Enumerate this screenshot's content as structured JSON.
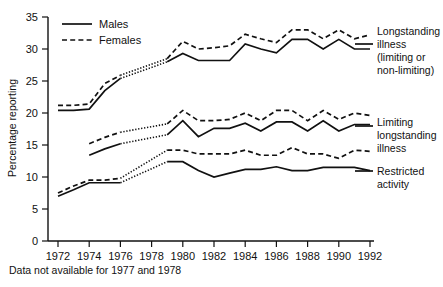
{
  "chart_data": {
    "type": "line",
    "title": "",
    "xlabel": "",
    "ylabel": "Percentage reporting",
    "xlim": [
      1972,
      1992
    ],
    "ylim": [
      0,
      35
    ],
    "grid": false,
    "legend_position": "top-left",
    "x_ticks": [
      1972,
      1974,
      1976,
      1978,
      1980,
      1982,
      1984,
      1986,
      1988,
      1990,
      1992
    ],
    "y_ticks": [
      0,
      5,
      10,
      15,
      20,
      25,
      30,
      35
    ],
    "footnote": "Data not available for 1977 and 1978",
    "legend": [
      {
        "label": "Males",
        "style": "solid"
      },
      {
        "label": "Females",
        "style": "dashed"
      }
    ],
    "annotations": [
      {
        "id": "longstanding",
        "lines": [
          "Longstanding",
          "illness",
          "(limiting or",
          "non-limiting)"
        ]
      },
      {
        "id": "limiting",
        "lines": [
          "Limiting",
          "longstanding",
          "illness"
        ]
      },
      {
        "id": "restricted",
        "lines": [
          "Restricted",
          "activity"
        ]
      }
    ],
    "gap_years": [
      1977,
      1978
    ],
    "series": [
      {
        "name": "Longstanding illness (limiting or non-limiting) - Males",
        "group": "longstanding",
        "sex": "Males",
        "style": "solid",
        "x": [
          1972,
          1973,
          1974,
          1975,
          1976,
          1979,
          1980,
          1981,
          1982,
          1983,
          1984,
          1985,
          1986,
          1987,
          1988,
          1989,
          1990,
          1991,
          1992
        ],
        "values": [
          20.4,
          20.4,
          20.6,
          23.5,
          25.4,
          28.0,
          29.3,
          28.2,
          28.2,
          28.2,
          30.8,
          30.0,
          29.4,
          31.5,
          31.5,
          30.0,
          31.5,
          30.0,
          30.0
        ]
      },
      {
        "name": "Longstanding illness (limiting or non-limiting) - Females",
        "group": "longstanding",
        "sex": "Females",
        "style": "dashed",
        "x": [
          1972,
          1973,
          1974,
          1975,
          1976,
          1979,
          1980,
          1981,
          1982,
          1983,
          1984,
          1985,
          1986,
          1987,
          1988,
          1989,
          1990,
          1991,
          1992
        ],
        "values": [
          21.2,
          21.2,
          21.4,
          24.6,
          25.9,
          28.5,
          31.2,
          30.0,
          30.2,
          30.5,
          32.3,
          31.6,
          31.0,
          33.0,
          33.0,
          31.6,
          33.0,
          31.6,
          32.2
        ]
      },
      {
        "name": "Limiting longstanding illness - Males",
        "group": "limiting",
        "sex": "Males",
        "style": "solid",
        "x": [
          1974,
          1975,
          1976,
          1979,
          1980,
          1981,
          1982,
          1983,
          1984,
          1985,
          1986,
          1987,
          1988,
          1989,
          1990,
          1991,
          1992
        ],
        "values": [
          13.4,
          14.4,
          15.2,
          16.6,
          18.8,
          16.3,
          17.6,
          17.6,
          18.4,
          17.2,
          18.6,
          18.6,
          17.2,
          18.8,
          17.2,
          18.2,
          18.2
        ]
      },
      {
        "name": "Limiting longstanding illness - Females",
        "group": "limiting",
        "sex": "Females",
        "style": "dashed",
        "x": [
          1974,
          1975,
          1976,
          1979,
          1980,
          1981,
          1982,
          1983,
          1984,
          1985,
          1986,
          1987,
          1988,
          1989,
          1990,
          1991,
          1992
        ],
        "values": [
          15.2,
          16.2,
          17.0,
          18.3,
          20.4,
          18.8,
          18.8,
          19.0,
          20.0,
          18.8,
          20.4,
          20.4,
          18.8,
          20.4,
          19.0,
          20.0,
          19.6
        ]
      },
      {
        "name": "Restricted activity - Males",
        "group": "restricted",
        "sex": "Males",
        "style": "solid",
        "x": [
          1972,
          1973,
          1974,
          1975,
          1976,
          1979,
          1980,
          1981,
          1982,
          1983,
          1984,
          1985,
          1986,
          1987,
          1988,
          1989,
          1990,
          1991,
          1992
        ],
        "values": [
          7.0,
          8.0,
          9.1,
          9.1,
          9.1,
          12.4,
          12.4,
          11.0,
          10.0,
          10.6,
          11.2,
          11.2,
          11.6,
          11.0,
          11.0,
          11.5,
          11.5,
          11.5,
          11.0
        ]
      },
      {
        "name": "Restricted activity - Females",
        "group": "restricted",
        "sex": "Females",
        "style": "dashed",
        "x": [
          1972,
          1973,
          1974,
          1975,
          1976,
          1979,
          1980,
          1981,
          1982,
          1983,
          1984,
          1985,
          1986,
          1987,
          1988,
          1989,
          1990,
          1991,
          1992
        ],
        "values": [
          7.5,
          8.6,
          9.5,
          9.5,
          9.8,
          14.2,
          14.2,
          13.6,
          13.6,
          13.6,
          14.2,
          13.4,
          13.4,
          14.6,
          13.6,
          13.6,
          12.9,
          14.2,
          14.0
        ]
      }
    ]
  }
}
